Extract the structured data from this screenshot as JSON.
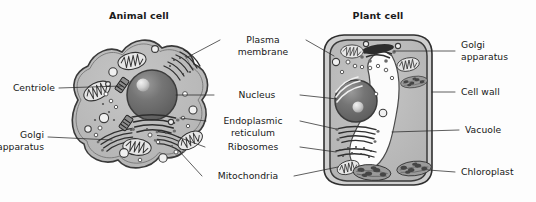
{
  "figure": {
    "background_color": "#fdfdfd",
    "width": 536,
    "height": 202
  },
  "titles": {
    "animal": "Animal cell",
    "plant": "Plant cell"
  },
  "colors": {
    "cytoplasm": "#b9b9b9",
    "cytoplasm_light": "#c9c9c9",
    "nucleus": "#6e6e6e",
    "nucleolus": "#d8d8d8",
    "membrane_stroke": "#3a3a3a",
    "organelle_fill": "#a5a5a5",
    "chloroplast_fill": "#8a8a8a",
    "vacuole": "#fdfdfd",
    "cellwall_fill": "#cfcfcf",
    "text": "#171717",
    "leader": "#2a2a2a"
  },
  "labels": {
    "centriole": "Centriole",
    "golgi_left_line1": "Golgi",
    "golgi_left_line2": "apparatus",
    "plasma_membrane_line1": "Plasma",
    "plasma_membrane_line2": "membrane",
    "nucleus": "Nucleus",
    "er_line1": "Endoplasmic",
    "er_line2": "reticulum",
    "ribosomes": "Ribosomes",
    "mitochondria": "Mitochondria",
    "golgi_right_line1": "Golgi",
    "golgi_right_line2": "apparatus",
    "cell_wall": "Cell wall",
    "vacuole": "Vacuole",
    "chloroplast": "Chloroplast"
  },
  "structures": {
    "animal_cell": [
      "plasma-membrane",
      "nucleus",
      "nucleolus",
      "endoplasmic-reticulum",
      "golgi-apparatus",
      "mitochondria",
      "ribosomes",
      "centriole",
      "vesicles"
    ],
    "plant_cell": [
      "cell-wall",
      "plasma-membrane",
      "nucleus",
      "nucleolus",
      "endoplasmic-reticulum",
      "golgi-apparatus",
      "mitochondria",
      "ribosomes",
      "chloroplast",
      "vacuole",
      "vesicles"
    ]
  }
}
